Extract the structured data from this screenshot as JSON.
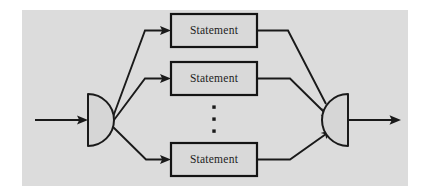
{
  "figure": {
    "panel": {
      "background_color": "#dcdcdc",
      "x": 22,
      "y": 10,
      "width": 386,
      "height": 176
    },
    "colors": {
      "stroke": "#1a1a1a",
      "box_fill": "#d9d9d9",
      "node_fill": "#d6d6d6",
      "page_background": "#ffffff"
    },
    "nodes": [
      {
        "id": "fork",
        "name": "fork-node",
        "shape": "half-disc-right",
        "label": "",
        "cx": 88,
        "cy": 120,
        "radius": 26
      },
      {
        "id": "join",
        "name": "join-node",
        "shape": "half-disc-left",
        "label": "",
        "cx": 348,
        "cy": 120,
        "radius": 26
      }
    ],
    "boxes": [
      {
        "id": "stmt-1",
        "label": "Statement",
        "x": 171,
        "y": 14,
        "width": 86,
        "height": 33
      },
      {
        "id": "stmt-2",
        "label": "Statement",
        "x": 171,
        "y": 62,
        "width": 86,
        "height": 33
      },
      {
        "id": "stmt-3",
        "label": "Statement",
        "x": 171,
        "y": 143,
        "width": 86,
        "height": 33
      }
    ],
    "ellipsis": {
      "name": "vertical-ellipsis",
      "symbol": "⋮",
      "dot_count": 3,
      "x": 214,
      "ys": [
        107,
        119,
        131
      ]
    },
    "edges": [
      {
        "id": "edge-in",
        "name": "input-arrow",
        "from": "entry",
        "to": "fork"
      },
      {
        "id": "edge-fork-1",
        "name": "fork-to-statement-1",
        "from": "fork",
        "to": "stmt-1"
      },
      {
        "id": "edge-fork-2",
        "name": "fork-to-statement-2",
        "from": "fork",
        "to": "stmt-2"
      },
      {
        "id": "edge-fork-3",
        "name": "fork-to-statement-3",
        "from": "fork",
        "to": "stmt-3"
      },
      {
        "id": "edge-join-1",
        "name": "statement-1-to-join",
        "from": "stmt-1",
        "to": "join"
      },
      {
        "id": "edge-join-2",
        "name": "statement-2-to-join",
        "from": "stmt-2",
        "to": "join"
      },
      {
        "id": "edge-join-3",
        "name": "statement-3-to-join",
        "from": "stmt-3",
        "to": "join"
      },
      {
        "id": "edge-out",
        "name": "output-arrow",
        "from": "join",
        "to": "exit"
      }
    ]
  }
}
